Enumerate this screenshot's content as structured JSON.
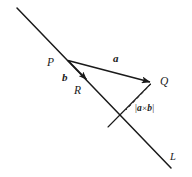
{
  "figure": {
    "kind": "vector-geometry-diagram",
    "background_color": "#ffffff",
    "stroke_color": "#1a1a1a",
    "width": 192,
    "height": 177,
    "labels": {
      "point_p": "P",
      "point_q": "Q",
      "point_r": "R",
      "vector_a": "a",
      "vector_b": "b",
      "line_l": "L",
      "distance_bar_open": "|",
      "distance_a": "a",
      "distance_times": "×",
      "distance_b": "b",
      "distance_bar_close": "|"
    },
    "geometry": {
      "line_start": [
        17,
        8
      ],
      "line_end": [
        171,
        168
      ],
      "point_p": [
        67,
        60
      ],
      "point_q": [
        151,
        83
      ],
      "point_r": [
        88,
        81
      ],
      "perpendicular_foot": [
        127,
        109
      ]
    }
  }
}
